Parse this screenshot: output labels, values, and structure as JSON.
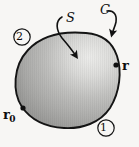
{
  "figure": {
    "type": "contour-surface-diagram",
    "background_color": "#f7f6f4",
    "outline_color": "#141414",
    "labels": {
      "surface": "S",
      "contour": "C",
      "position_vector": "r",
      "reference_vector_base": "r",
      "reference_vector_subscript": "0",
      "region_one": "1",
      "region_two": "2"
    },
    "markers": [
      {
        "name": "point-r0",
        "label": "r0",
        "x": 23,
        "y": 108
      },
      {
        "name": "point-r",
        "label": "r",
        "x": 116,
        "y": 65
      }
    ],
    "annotations": [
      {
        "name": "arrow-to-surface",
        "label": "S",
        "points_to": "surface-interior"
      },
      {
        "name": "arrow-to-contour",
        "label": "C",
        "points_to": "boundary-curve"
      }
    ],
    "shading": {
      "highlight_color": "#f2f2f0",
      "mid_color": "#b6b6b4",
      "shadow_color": "#8a8a88",
      "highlight_position": "upper-right"
    }
  }
}
